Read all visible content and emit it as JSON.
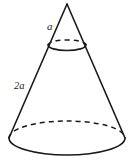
{
  "figure": {
    "name": "truncated-cone-diagram",
    "background_color": "#ffffff",
    "stroke_color": "#1a1a1a",
    "labels": {
      "upper_slant": "a",
      "lower_slant": "2a"
    },
    "geometry": {
      "apex": {
        "x": 67,
        "y": 4
      },
      "upper_ellipse": {
        "cx": 67,
        "cy": 45,
        "rx": 19,
        "ry": 5
      },
      "base_ellipse": {
        "cx": 67,
        "cy": 138,
        "rx": 58,
        "ry": 17
      }
    }
  },
  "label_positions": {
    "upper_slant": {
      "x": 47,
      "y": 30
    },
    "lower_slant": {
      "x": 14,
      "y": 89
    }
  }
}
